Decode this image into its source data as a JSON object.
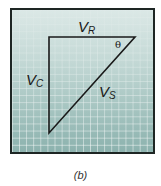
{
  "diagram": {
    "type": "phasor-voltage-triangle",
    "caption": "(b)",
    "colors": {
      "frame_border": "#1e2624",
      "background_top": "#dbe8e6",
      "background_bottom": "#8cb2ae",
      "grid_lines": "#ffffff",
      "triangle_stroke": "#1a1a1a"
    },
    "triangle": {
      "vertices": {
        "top_left": [
          49,
          37
        ],
        "top_right": [
          135,
          37
        ],
        "bottom_left": [
          49,
          133
        ]
      },
      "sides": {
        "top": {
          "symbol": "V",
          "subscript": "R"
        },
        "left": {
          "symbol": "V",
          "subscript": "C"
        },
        "hypotenuse": {
          "symbol": "V",
          "subscript": "S"
        }
      },
      "angle": {
        "symbol": "θ",
        "at": "top_right"
      }
    }
  }
}
